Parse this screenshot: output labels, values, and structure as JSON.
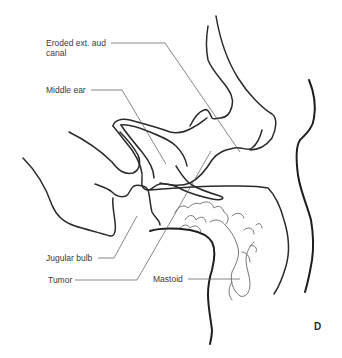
{
  "figure": {
    "panel_letter": "D",
    "labels": [
      {
        "id": "eroded-ext-aud-canal",
        "lines": [
          "Eroded ext. aud",
          "canal"
        ]
      },
      {
        "id": "middle-ear",
        "lines": [
          "Middle ear"
        ]
      },
      {
        "id": "jugular-bulb",
        "lines": [
          "Jugular bulb"
        ]
      },
      {
        "id": "tumor",
        "lines": [
          "Tumor"
        ]
      },
      {
        "id": "mastoid",
        "lines": [
          "Mastoid"
        ]
      }
    ],
    "colors": {
      "background": "#ffffff",
      "line": "#2a2a2a",
      "text": "#3a3a3a"
    }
  }
}
